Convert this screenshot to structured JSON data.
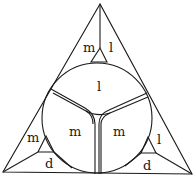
{
  "diagram": {
    "type": "triangle-with-inscribed-circle",
    "colors": {
      "stroke": "#1a1a1a",
      "background": "#ffffff"
    },
    "labels": {
      "top_left": "m",
      "top_right": "l",
      "circle_top": "l",
      "circle_left": "m",
      "circle_right": "m",
      "left_upper": "m",
      "left_lower": "d",
      "right_upper": "l",
      "right_lower": "d"
    }
  }
}
